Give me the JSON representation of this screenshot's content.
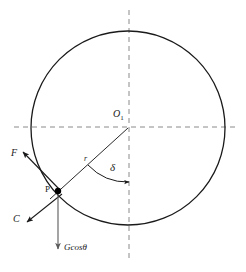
{
  "figure": {
    "background_color": "#ffffff",
    "stroke_color": "#1a1a1a",
    "axis_color": "#8a8a8a"
  },
  "labels": {
    "center": "O",
    "center_subscript": "1",
    "point": "P",
    "radius": "r",
    "angle": "δ",
    "force_f": "F",
    "force_c": "C",
    "weight_prefix": "Gcos",
    "weight_symbol": "θ"
  },
  "geometry": {
    "circle": {
      "cx": 128,
      "cy": 128,
      "r": 97
    },
    "center_point": {
      "x": 128,
      "y": 128
    },
    "point_p": {
      "x": 58,
      "y": 191
    },
    "horizontal_axis": {
      "x1": 14,
      "y1": 127,
      "x2": 237,
      "y2": 127
    },
    "vertical_axis": {
      "x1": 129,
      "y1": 10,
      "x2": 129,
      "y2": 260
    },
    "radius_line": {
      "x1": 128,
      "y1": 128,
      "x2": 52,
      "y2": 197
    },
    "force_f_arrow": {
      "x1": 60,
      "y1": 190,
      "x2": 22,
      "y2": 151
    },
    "force_c_arrow": {
      "x1": 62,
      "y1": 194,
      "x2": 25,
      "y2": 223
    },
    "weight_arrow": {
      "x1": 58,
      "y1": 193,
      "x2": 58,
      "y2": 250
    },
    "angle_arc": {
      "cx": 128,
      "cy": 128,
      "radius": 54,
      "start_deg": 222,
      "end_deg": 90
    }
  },
  "annotations": {
    "angle_description": "delta measured from downward vertical to radius OP",
    "force_f_description": "tangential force F at point P directed up-left",
    "force_c_description": "force C at point P directed down-left",
    "weight_description": "weight component Gcos-theta acting vertically downward at P"
  }
}
